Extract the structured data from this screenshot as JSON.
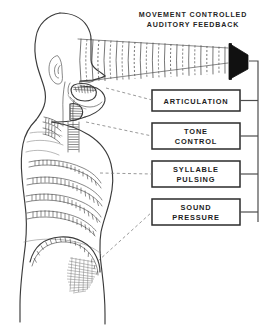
{
  "figure": {
    "title_line1": "MOVEMENT  CONTROLLED",
    "title_line2": "AUDITORY  FEEDBACK",
    "caption": ""
  },
  "boxes": [
    {
      "id": "articulation",
      "label_line1": "ARTICULATION",
      "label_line2": ""
    },
    {
      "id": "tone-control",
      "label_line1": "TONE",
      "label_line2": "CONTROL"
    },
    {
      "id": "syllable-pulsing",
      "label_line1": "SYLLABLE",
      "label_line2": "PULSING"
    },
    {
      "id": "sound-pressure",
      "label_line1": "SOUND",
      "label_line2": "PRESSURE"
    }
  ],
  "anatomy": {
    "head_label": "head-profile",
    "ear_label": "ear",
    "tongue_label": "tongue",
    "larynx_label": "larynx",
    "ribcage_label": "ribcage-intercostals",
    "diaphragm_label": "diaphragm"
  },
  "graphics": {
    "speaker_icon": "speaker-horn-icon",
    "sound_waves": "sound-wave-lines",
    "wire_bus": "signal-bus-line"
  },
  "colors": {
    "ink": "#262626",
    "line": "#3b3b3b",
    "faint": "#8a8a8a",
    "paper": "#ffffff",
    "horn_fill": "#111111"
  }
}
